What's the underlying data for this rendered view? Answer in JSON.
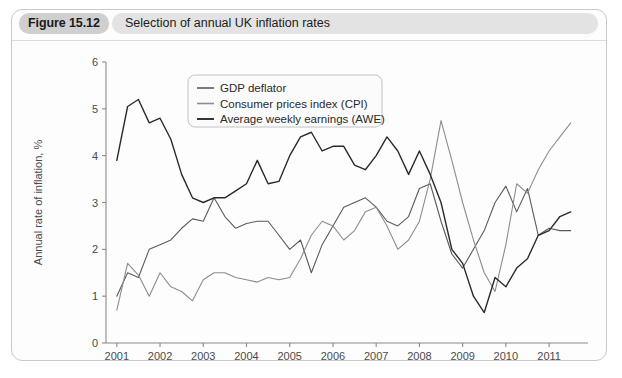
{
  "figure": {
    "tag": "Figure 15.12",
    "caption": "Selection of annual UK inflation rates"
  },
  "colors": {
    "card_border": "#c9c9c9",
    "tag_background": "#cfcfcf",
    "caption_background": "#e3e3e3",
    "axis": "#8a8a8a",
    "gdp_deflator": "#5a5a5a",
    "cpi": "#8d8d8d",
    "awe": "#2b2b2b"
  },
  "chart_data": {
    "type": "line",
    "title": "Selection of annual UK inflation rates",
    "xlabel": "",
    "ylabel": "Annual rate of inflation, %",
    "xlim": [
      2000.75,
      2011.9
    ],
    "ylim": [
      0,
      6
    ],
    "yticks": [
      0,
      1,
      2,
      3,
      4,
      5,
      6
    ],
    "xticks": [
      2001,
      2002,
      2003,
      2004,
      2005,
      2006,
      2007,
      2008,
      2009,
      2010,
      2011
    ],
    "grid": false,
    "legend_position": "top-center",
    "x": [
      2001.0,
      2001.25,
      2001.5,
      2001.75,
      2002.0,
      2002.25,
      2002.5,
      2002.75,
      2003.0,
      2003.25,
      2003.5,
      2003.75,
      2004.0,
      2004.25,
      2004.5,
      2004.75,
      2005.0,
      2005.25,
      2005.5,
      2005.75,
      2006.0,
      2006.25,
      2006.5,
      2006.75,
      2007.0,
      2007.25,
      2007.5,
      2007.75,
      2008.0,
      2008.25,
      2008.5,
      2008.75,
      2009.0,
      2009.25,
      2009.5,
      2009.75,
      2010.0,
      2010.25,
      2010.5,
      2010.75,
      2011.0,
      2011.25,
      2011.5
    ],
    "series": [
      {
        "name": "GDP deflator",
        "values": [
          1.0,
          1.5,
          1.4,
          2.0,
          2.1,
          2.2,
          2.45,
          2.65,
          2.6,
          3.1,
          2.7,
          2.45,
          2.55,
          2.6,
          2.6,
          2.3,
          2.0,
          2.2,
          1.5,
          2.1,
          2.5,
          2.9,
          3.0,
          3.1,
          2.9,
          2.6,
          2.5,
          2.7,
          3.3,
          3.4,
          2.6,
          1.9,
          1.6,
          2.0,
          2.4,
          3.0,
          3.35,
          2.8,
          3.3,
          2.3,
          2.45,
          2.4,
          2.4
        ]
      },
      {
        "name": "Consumer prices index (CPI)",
        "values": [
          0.7,
          1.7,
          1.45,
          1.0,
          1.5,
          1.2,
          1.1,
          0.9,
          1.35,
          1.5,
          1.5,
          1.4,
          1.35,
          1.3,
          1.4,
          1.35,
          1.4,
          1.8,
          2.3,
          2.6,
          2.5,
          2.2,
          2.4,
          2.8,
          2.9,
          2.5,
          2.0,
          2.2,
          2.6,
          3.5,
          4.75,
          3.9,
          3.0,
          2.2,
          1.5,
          1.1,
          2.1,
          3.4,
          3.2,
          3.7,
          4.1,
          4.4,
          4.7
        ]
      },
      {
        "name": "Average weekly earnings (AWE)",
        "values": [
          3.9,
          5.05,
          5.2,
          4.7,
          4.8,
          4.35,
          3.6,
          3.1,
          3.0,
          3.1,
          3.1,
          3.25,
          3.4,
          3.9,
          3.4,
          3.45,
          4.0,
          4.4,
          4.5,
          4.1,
          4.2,
          4.2,
          3.8,
          3.7,
          4.0,
          4.4,
          4.1,
          3.6,
          4.1,
          3.6,
          3.0,
          2.0,
          1.7,
          1.0,
          0.65,
          1.4,
          1.2,
          1.6,
          1.8,
          2.3,
          2.4,
          2.7,
          2.8
        ]
      }
    ]
  },
  "legend": {
    "entries": [
      {
        "label": "GDP deflator"
      },
      {
        "label": "Consumer prices index (CPI)"
      },
      {
        "label": "Average weekly earnings (AWE)"
      }
    ]
  }
}
